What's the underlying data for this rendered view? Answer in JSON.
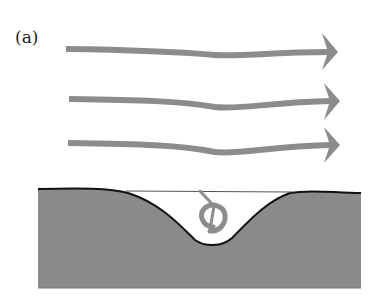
{
  "figure": {
    "panel_label": "(a)",
    "arrows": [
      {
        "name": "flow-arrow-top",
        "y": 50
      },
      {
        "name": "flow-arrow-middle",
        "y": 100
      },
      {
        "name": "flow-arrow-bottom",
        "y": 143
      }
    ],
    "colors": {
      "arrow": "#8c8c8c",
      "ground": "#8a8a8a",
      "surface_line": "#111111",
      "water_line": "#555555",
      "vortex": "#8c8c8c"
    }
  }
}
